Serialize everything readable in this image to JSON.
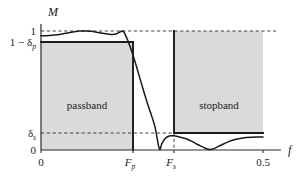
{
  "chart_data": {
    "type": "line",
    "title": "",
    "xlabel": "f",
    "ylabel": "M",
    "xlim": [
      0,
      0.5
    ],
    "ylim": [
      0,
      1.12
    ],
    "grid": false,
    "legend": null,
    "x_ticks": [
      {
        "value": 0,
        "label": "0"
      },
      {
        "value": 0.1845,
        "label": "F",
        "sub": "p"
      },
      {
        "value": 0.2665,
        "label": "F",
        "sub": "s"
      },
      {
        "value": 0.5,
        "label": "0.5"
      }
    ],
    "y_ticks": [
      {
        "value": 1.0,
        "label": "1"
      },
      {
        "value": 0.905,
        "label": "1 − δ",
        "sub": "p"
      },
      {
        "value": 0.155,
        "label": "δ",
        "sub": "s"
      },
      {
        "value": 0.0,
        "label": "0"
      }
    ],
    "regions": [
      {
        "name": "passband",
        "label": "passband",
        "x_range": [
          0,
          0.1845
        ],
        "y_range": [
          0,
          0.905
        ]
      },
      {
        "name": "stopband",
        "label": "stopband",
        "x_range": [
          0.2665,
          0.5
        ],
        "y_range": [
          0.155,
          1.0
        ]
      }
    ],
    "reference_lines": [
      {
        "axis": "y",
        "value": 1.0,
        "style": "dashed"
      },
      {
        "axis": "y",
        "value": 0.155,
        "style": "dashed"
      },
      {
        "axis": "x",
        "value": 0.2665,
        "style": "dashed"
      }
    ],
    "series": [
      {
        "name": "magnitude-response",
        "x": [
          0.0,
          0.012,
          0.025,
          0.037,
          0.05,
          0.062,
          0.075,
          0.087,
          0.1,
          0.112,
          0.125,
          0.137,
          0.15,
          0.158,
          0.166,
          0.172,
          0.178,
          0.1845,
          0.19,
          0.196,
          0.203,
          0.212,
          0.221,
          0.23,
          0.239,
          0.248,
          0.257,
          0.2665,
          0.272,
          0.28,
          0.289,
          0.298,
          0.31,
          0.325,
          0.34,
          0.355,
          0.368,
          0.38,
          0.392,
          0.405,
          0.42,
          0.437,
          0.455,
          0.473,
          0.49,
          0.5
        ],
        "y": [
          0.96,
          0.961,
          0.964,
          0.969,
          0.976,
          0.985,
          0.993,
          0.999,
          1.0,
          0.997,
          0.99,
          0.982,
          0.974,
          0.971,
          0.972,
          0.98,
          0.992,
          1.0,
          0.968,
          0.915,
          0.845,
          0.74,
          0.625,
          0.51,
          0.4,
          0.3,
          0.19,
          0.01,
          0.052,
          0.098,
          0.118,
          0.12,
          0.112,
          0.096,
          0.072,
          0.042,
          0.018,
          0.004,
          0.016,
          0.04,
          0.066,
          0.088,
          0.101,
          0.107,
          0.109,
          0.109
        ]
      }
    ]
  },
  "annotations": {
    "y_axis_title": "M",
    "x_axis_title": "f"
  }
}
